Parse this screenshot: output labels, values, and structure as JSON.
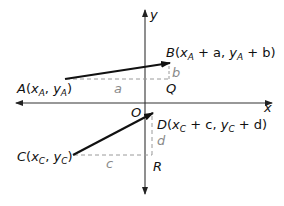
{
  "diagram": {
    "type": "coordinate-translation",
    "axes": {
      "x_label": "x",
      "y_label": "y",
      "origin_label": "O"
    },
    "points": {
      "A": {
        "name": "A",
        "coord_x": "x",
        "coord_x_sub": "A",
        "coord_y": "y",
        "coord_y_sub": "A"
      },
      "B": {
        "name": "B",
        "coord_x": "x",
        "coord_x_sub": "A",
        "coord_x_offset": " + a, ",
        "coord_y": "y",
        "coord_y_sub": "A",
        "coord_y_offset": " + b)"
      },
      "C": {
        "name": "C",
        "coord_x": "x",
        "coord_x_sub": "C",
        "coord_y": "y",
        "coord_y_sub": "C"
      },
      "D": {
        "name": "D",
        "coord_x": "x",
        "coord_x_sub": "C",
        "coord_x_offset": " + c, ",
        "coord_y": "y",
        "coord_y_sub": "C",
        "coord_y_offset": " + d)"
      },
      "Q": {
        "name": "Q"
      },
      "R": {
        "name": "R"
      }
    },
    "segment_labels": {
      "a": "a",
      "b": "b",
      "c": "c",
      "d": "d"
    },
    "vectors": [
      {
        "from": "A",
        "to": "B"
      },
      {
        "from": "C",
        "to": "D"
      }
    ],
    "colors": {
      "line": "#111111",
      "dashed": "#9a9a9a",
      "label_gray": "#8a8a8a"
    }
  }
}
